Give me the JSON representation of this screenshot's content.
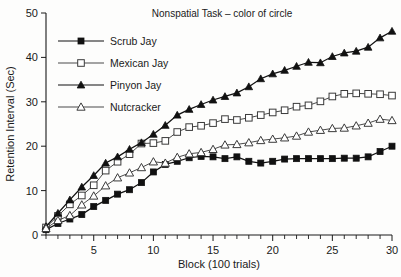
{
  "chart_data": {
    "type": "line",
    "title": "Nonspatial Task – color of circle",
    "xlabel": "Block (100 trials)",
    "ylabel": "Retention Interval (Sec)",
    "xlim": [
      1,
      30
    ],
    "ylim": [
      0,
      50
    ],
    "xticks": [
      5,
      10,
      15,
      20,
      25,
      30
    ],
    "xticklabels": [
      "5",
      "10",
      "15",
      "20",
      "25",
      "30"
    ],
    "yticks": [
      0,
      10,
      20,
      30,
      40,
      50
    ],
    "yticklabels": [
      "0",
      "10",
      "20",
      "30",
      "40",
      "50"
    ],
    "x_minor_tick_step": 1,
    "grid": false,
    "legend_position": "upper-left",
    "x": [
      1,
      2,
      3,
      4,
      5,
      6,
      7,
      8,
      9,
      10,
      11,
      12,
      13,
      14,
      15,
      16,
      17,
      18,
      19,
      20,
      21,
      22,
      23,
      24,
      25,
      26,
      27,
      28,
      29,
      30
    ],
    "series": [
      {
        "name": "Scrub Jay",
        "marker": "filled-square",
        "color": "#111111",
        "values": [
          1.2,
          2.6,
          3.6,
          4.6,
          6.4,
          7.8,
          9.2,
          10.2,
          11.8,
          14.2,
          15.9,
          16.6,
          17.4,
          17.7,
          17.6,
          17.2,
          17.6,
          16.6,
          16.2,
          16.6,
          17.1,
          17.2,
          17.2,
          17.2,
          17.2,
          17.3,
          17.3,
          17.6,
          18.8,
          20.0
        ]
      },
      {
        "name": "Mexican Jay",
        "marker": "open-square",
        "color": "#ffffff",
        "values": [
          1.7,
          4.3,
          6.9,
          8.9,
          11.2,
          14.5,
          16.5,
          18.2,
          20.6,
          20.7,
          21.2,
          23.2,
          24.3,
          24.6,
          25.2,
          26.1,
          25.9,
          26.4,
          27.0,
          27.6,
          28.1,
          28.9,
          29.2,
          30.1,
          31.2,
          31.8,
          31.9,
          31.8,
          31.7,
          31.4
        ]
      },
      {
        "name": "Pinyon Jay",
        "marker": "filled-triangle",
        "color": "#111111",
        "values": [
          1.9,
          4.9,
          7.9,
          10.8,
          13.4,
          16.2,
          17.6,
          19.3,
          20.8,
          22.7,
          24.7,
          27.0,
          28.3,
          29.4,
          30.4,
          31.2,
          32.0,
          33.4,
          35.2,
          36.3,
          37.1,
          38.0,
          38.9,
          38.8,
          40.2,
          41.0,
          41.4,
          42.3,
          44.4,
          45.9
        ]
      },
      {
        "name": "Nutcracker",
        "marker": "open-triangle",
        "color": "#ffffff",
        "values": [
          1.5,
          3.3,
          4.4,
          6.8,
          8.8,
          11.1,
          12.9,
          14.0,
          15.2,
          16.5,
          16.2,
          17.5,
          18.3,
          18.6,
          19.3,
          20.3,
          20.4,
          20.8,
          21.3,
          21.6,
          21.9,
          22.3,
          23.2,
          23.6,
          24.0,
          24.1,
          24.6,
          25.2,
          26.1,
          25.8
        ]
      }
    ]
  }
}
